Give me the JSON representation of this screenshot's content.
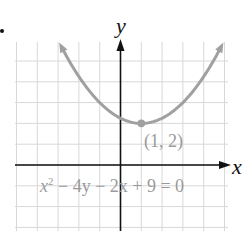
{
  "chart_data": {
    "type": "line",
    "title": "",
    "equation": "x² − 4y − 2x + 9 = 0",
    "xlabel": "x",
    "ylabel": "y",
    "xlim": [
      -5,
      5
    ],
    "ylim": [
      -3,
      6
    ],
    "grid": true,
    "legend": null,
    "series": [
      {
        "name": "parabola",
        "formula": "y = (x - 1)^2 / 4 + 2",
        "x": [
          -4.8,
          -4,
          -3,
          -2,
          -1,
          0,
          1,
          2,
          3,
          4,
          5
        ],
        "y": [
          10.41,
          8.25,
          6,
          4.25,
          3,
          2.25,
          2,
          2.25,
          3,
          4.25,
          6
        ],
        "color": "#a0a0a0",
        "arrows": "both"
      }
    ],
    "annotations": [
      {
        "type": "point",
        "x": 1,
        "y": 2,
        "label": "(1, 2)",
        "color": "#a0a0a0"
      }
    ],
    "colors": {
      "grid": "#d8d8d8",
      "axis": "#111111",
      "curve": "#a0a0a0",
      "text": "#9a9a9a"
    }
  },
  "labels": {
    "x_axis": "x",
    "y_axis": "y",
    "vertex": "(1, 2)",
    "equation_x": "x",
    "equation_exp": "2",
    "equation_rest": " − 4y − 2x + 9 = 0"
  }
}
